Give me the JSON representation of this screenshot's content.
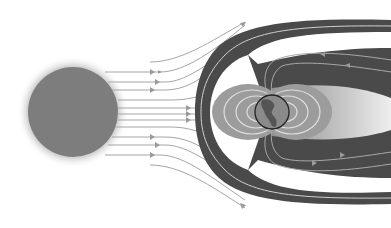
{
  "diagram": {
    "labels": [],
    "colors": {
      "background": "#ffffff",
      "sun": "#7d7d7d",
      "sun_glow": "#d9d9d9",
      "magnetosheath": "#4a4a4a",
      "field_lines": "#9a9a9a",
      "radiation_belts": "#9c9c9c",
      "magnetotail": "#b5b5b5",
      "earth": "#808080"
    },
    "elements": [
      {
        "id": "sun",
        "description": "Sun, grey disc on the left"
      },
      {
        "id": "solar-wind",
        "description": "Solar wind stream lines with arrows flowing right"
      },
      {
        "id": "bow-shock",
        "description": "Dark magnetosheath band around Earth"
      },
      {
        "id": "magnetosphere",
        "description": "Dipole field lines around Earth"
      },
      {
        "id": "magnetotail",
        "description": "Tapered tail extending right"
      },
      {
        "id": "earth",
        "description": "Earth globe showing the Americas"
      }
    ]
  }
}
